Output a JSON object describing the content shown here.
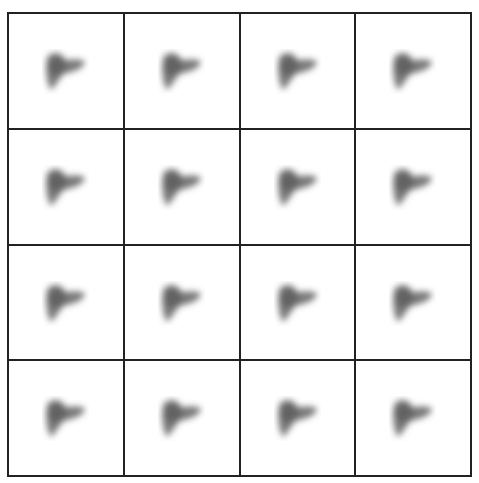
{
  "grid": {
    "rows": 4,
    "cols": 4
  },
  "frames": [
    {
      "label": "frame-1"
    },
    {
      "label": "frame-2"
    },
    {
      "label": "frame-3"
    },
    {
      "label": "frame-4"
    },
    {
      "label": "frame-5"
    },
    {
      "label": "frame-6"
    },
    {
      "label": "frame-7"
    },
    {
      "label": "frame-8"
    },
    {
      "label": "frame-9"
    },
    {
      "label": "frame-10"
    },
    {
      "label": "frame-11"
    },
    {
      "label": "frame-12"
    },
    {
      "label": "frame-13"
    },
    {
      "label": "frame-14"
    },
    {
      "label": "frame-15"
    },
    {
      "label": "frame-16"
    }
  ],
  "colors": {
    "blob": "#555555",
    "border": "#222222",
    "background": "#ffffff"
  }
}
